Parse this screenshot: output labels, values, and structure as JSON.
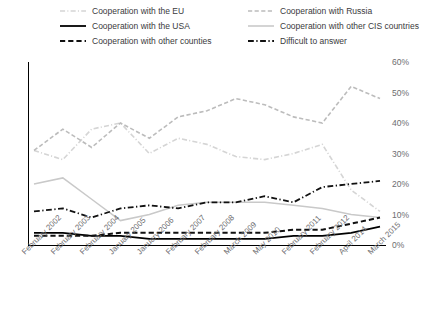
{
  "chart_data": {
    "type": "line",
    "title": "",
    "subtitle": "",
    "xlabel": "",
    "ylabel": "",
    "ylim": [
      0,
      60
    ],
    "ytick_labels": [
      "0%",
      "10%",
      "20%",
      "30%",
      "40%",
      "50%",
      "60%"
    ],
    "ytick_values": [
      0,
      10,
      20,
      30,
      40,
      50,
      60
    ],
    "grid": false,
    "legend_position": "top",
    "categories": [
      "February 2002",
      "February 2003",
      "February 2004",
      "January 2005",
      "January 2006",
      "February 2007",
      "February 2008",
      "March 2009",
      "May 2010",
      "February 2011",
      "February 2012",
      "April 2014",
      "March 2015"
    ],
    "series": [
      {
        "name": "Cooperation with the EU",
        "color": "#d5d5d5",
        "style": "dash-dot",
        "width": 1.6,
        "values": [
          31,
          28,
          38,
          40,
          30,
          35,
          33,
          29,
          28,
          30,
          33,
          18,
          11
        ]
      },
      {
        "name": "Cooperation with Russia",
        "color": "#bcbcbc",
        "style": "dashed",
        "width": 1.6,
        "values": [
          31,
          38,
          32,
          40,
          35,
          42,
          44,
          48,
          46,
          42,
          40,
          52,
          48
        ]
      },
      {
        "name": "Cooperation with the USA",
        "color": "#000000",
        "style": "solid",
        "width": 1.8,
        "values": [
          4,
          4,
          3,
          3,
          2,
          2,
          2,
          2,
          2,
          3,
          3,
          4,
          6
        ]
      },
      {
        "name": "Cooperation with other CIS countries",
        "color": "#c9c9c9",
        "style": "solid",
        "width": 1.5,
        "values": [
          20,
          22,
          15,
          8,
          10,
          13,
          14,
          14,
          14,
          13,
          12,
          10,
          9
        ]
      },
      {
        "name": "Cooperation with other counties",
        "color": "#111111",
        "style": "dashed",
        "width": 2.0,
        "values": [
          3,
          3,
          3,
          4,
          4,
          4,
          4,
          4,
          4,
          5,
          5,
          7,
          9
        ]
      },
      {
        "name": "Difficult to answer",
        "color": "#111111",
        "style": "dash-dot",
        "width": 1.8,
        "values": [
          11,
          12,
          9,
          12,
          13,
          12,
          14,
          14,
          16,
          14,
          19,
          20,
          21
        ]
      }
    ]
  },
  "legend": {
    "items": [
      {
        "label": "Cooperation with the EU",
        "series_index": 0
      },
      {
        "label": "Cooperation with Russia",
        "series_index": 1
      },
      {
        "label": "Cooperation with the USA",
        "series_index": 2
      },
      {
        "label": "Cooperation with other CIS countries",
        "series_index": 3
      },
      {
        "label": "Cooperation with other counties",
        "series_index": 4
      },
      {
        "label": "Difficult to answer",
        "series_index": 5
      }
    ]
  }
}
